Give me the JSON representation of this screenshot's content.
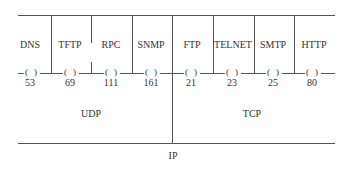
{
  "diagram": {
    "application_protocols": [
      {
        "name": "DNS",
        "port": "53",
        "transport": "UDP",
        "x": 30
      },
      {
        "name": "TFTP",
        "port": "69",
        "transport": "UDP",
        "x": 70
      },
      {
        "name": "RPC",
        "port": "111",
        "transport": "UDP",
        "x": 111
      },
      {
        "name": "SNMP",
        "port": "161",
        "transport": "UDP",
        "x": 151
      },
      {
        "name": "FTP",
        "port": "21",
        "transport": "TCP",
        "x": 192
      },
      {
        "name": "TELNET",
        "port": "23",
        "transport": "TCP",
        "x": 232
      },
      {
        "name": "SMTP",
        "port": "25",
        "transport": "TCP",
        "x": 273
      },
      {
        "name": "HTTP",
        "port": "80",
        "transport": "TCP",
        "x": 313
      }
    ],
    "port_marker": "(   )",
    "transport_layers": [
      {
        "name": "UDP",
        "x": 91
      },
      {
        "name": "TCP",
        "x": 252
      }
    ],
    "network_layer": {
      "name": "IP",
      "x": 172
    },
    "line_color": "#555555"
  }
}
